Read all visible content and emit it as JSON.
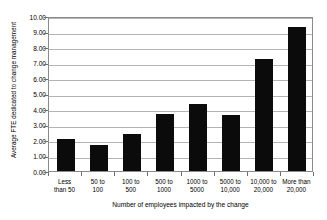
{
  "chart_data": {
    "type": "bar",
    "title": "",
    "xlabel": "Number of employees impacted by the change",
    "ylabel": "Average FTE dedicated to change management",
    "categories": [
      "Less\nthan 50",
      "50 to\n100",
      "100 to\n500",
      "500 to\n1000",
      "1000 to\n5000",
      "5000 to\n10,000",
      "10,000 to\n20,000",
      "More than\n20,000"
    ],
    "values": [
      2.05,
      1.7,
      2.38,
      3.67,
      4.35,
      3.6,
      7.25,
      9.3
    ],
    "ylim": [
      0,
      10
    ],
    "ytick_labels": [
      "10.00",
      "9.00",
      "8.00",
      "7.00",
      "6.00",
      "5.00",
      "4.00",
      "3.00",
      "2.00",
      "1.00",
      "0.00"
    ],
    "ytick_values": [
      10,
      9,
      8,
      7,
      6,
      5,
      4,
      3,
      2,
      1,
      0
    ],
    "grid": true,
    "legend": "none",
    "bar_color": "#0b0b0b",
    "grid_color": "#b4b4b4",
    "axis_color": "#8a8a8a",
    "background_color": "#ffffff"
  }
}
